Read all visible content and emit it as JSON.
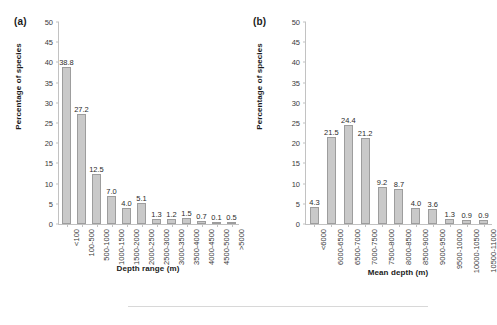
{
  "figure": {
    "background": "#ffffff",
    "bar_fill": "#c9c9c9",
    "bar_border": "#9d9d9d",
    "axis_color": "#c2c2c2"
  },
  "panels": [
    {
      "tag": "(a)"
    },
    {
      "tag": "(b)"
    }
  ],
  "chart_data": [
    {
      "type": "bar",
      "panel": "(a)",
      "title": "",
      "xlabel": "Depth range (m)",
      "ylabel": "Percentage of species",
      "ylim": [
        0,
        50
      ],
      "yticks": [
        0,
        5,
        10,
        15,
        20,
        25,
        30,
        35,
        40,
        45,
        50
      ],
      "grid": false,
      "legend": null,
      "categories": [
        "<100",
        "100-500",
        "500-1000",
        "1000-1500",
        "1500-2000",
        "2000-2500",
        "2500-3000",
        "3000-3500",
        "3500-4000",
        "4000-4500",
        "4500-5000",
        ">5000"
      ],
      "values": [
        38.8,
        27.2,
        12.5,
        7.0,
        4.0,
        5.1,
        1.3,
        1.2,
        1.5,
        0.7,
        0.1,
        0.5
      ],
      "data_labels": [
        "38.8",
        "27.2",
        "12.5",
        "7.0",
        "4.0",
        "5.1",
        "1.3",
        "1.2",
        "1.5",
        "0.7",
        "0.1",
        "0.5"
      ]
    },
    {
      "type": "bar",
      "panel": "(b)",
      "title": "",
      "xlabel": "Mean depth (m)",
      "ylabel": "Percentage of species",
      "ylim": [
        0,
        50
      ],
      "yticks": [
        0,
        5,
        10,
        15,
        20,
        25,
        30,
        35,
        40,
        45,
        50
      ],
      "grid": false,
      "legend": null,
      "categories": [
        "<6000",
        "6000-6500",
        "6500-7000",
        "7000-7500",
        "7500-8000",
        "8000-8500",
        "8500-9000",
        "9000-9500",
        "9500-10000",
        "10000-10500",
        "10500-11000"
      ],
      "values": [
        4.3,
        21.5,
        24.4,
        21.2,
        9.2,
        8.7,
        4.0,
        3.6,
        1.3,
        0.9,
        0.9
      ],
      "data_labels": [
        "4.3",
        "21.5",
        "24.4",
        "21.2",
        "9.2",
        "8.7",
        "4.0",
        "3.6",
        "1.3",
        "0.9",
        "0.9"
      ]
    }
  ]
}
